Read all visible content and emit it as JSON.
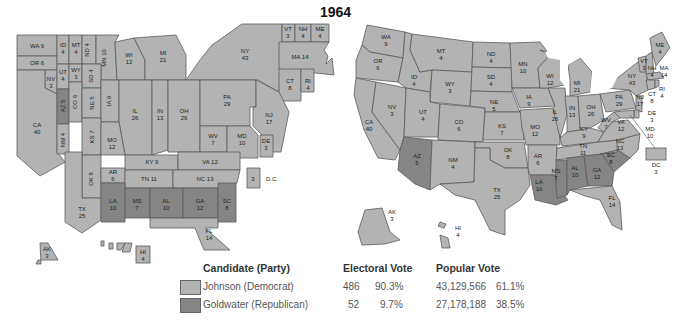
{
  "title": "1964",
  "colors": {
    "democrat": "#b3b3b3",
    "republican": "#858585",
    "border": "#5a5a5a"
  },
  "legend": {
    "headers": {
      "candidate": "Candidate (Party)",
      "electoral": "Electoral Vote",
      "popular": "Popular Vote"
    },
    "rows": [
      {
        "name": "Johnson (Democrat)",
        "party": "democrat",
        "ev": "486",
        "ev_pct": "90.3%",
        "pv": "43,129,566",
        "pv_pct": "61.1%"
      },
      {
        "name": "Goldwater (Republican)",
        "party": "republican",
        "ev": "52",
        "ev_pct": "9.7%",
        "pv": "27,178,188",
        "pv_pct": "38.5%"
      }
    ]
  },
  "cartogram": {
    "WA": "WA 9",
    "OR": "OR 6",
    "ID": "ID",
    "ID_v": "4",
    "MT": "MT",
    "MT_v": "4",
    "ND": "ND 4",
    "MN": "MN 10",
    "WI": "WI",
    "WI_v": "12",
    "MI": "MI",
    "MI_v": "21",
    "NY": "NY",
    "NY_v": "43",
    "VT": "VT",
    "VT_v": "3",
    "NH": "NH",
    "NH_v": "4",
    "ME": "ME",
    "ME_v": "4",
    "MA": "MA 14",
    "CT": "CT",
    "CT_v": "8",
    "RI": "RI",
    "RI_v": "4",
    "NV": "NV",
    "NV_v": "3",
    "UT": "UT",
    "UT_v": "4",
    "WY": "WY",
    "WY_v": "3",
    "SD": "SD 4",
    "CA": "CA",
    "CA_v": "40",
    "AZ": "AZ 5",
    "CO": "CO 6",
    "NE": "NE 5",
    "IA": "IA 9",
    "IL": "IL",
    "IL_v": "26",
    "IN": "IN",
    "IN_v": "13",
    "OH": "OH",
    "OH_v": "26",
    "PA": "PA",
    "PA_v": "29",
    "NJ": "NJ",
    "NJ_v": "17",
    "NM": "NM 4",
    "KS": "KS 7",
    "MO": "MO",
    "MO_v": "12",
    "WV": "WV",
    "WV_v": "7",
    "MD": "MD",
    "MD_v": "10",
    "DE": "DE",
    "DE_v": "3",
    "KY": "KY 9",
    "VA": "VA 12",
    "OK": "OK 8",
    "AR": "AR",
    "AR_v": "6",
    "TN": "TN 11",
    "NC": "NC 13",
    "DC": "3",
    "DC_label": "D.C.",
    "TX": "TX",
    "TX_v": "25",
    "LA": "LA",
    "LA_v": "10",
    "MS": "MS",
    "MS_v": "7",
    "AL": "AL",
    "AL_v": "10",
    "GA": "GA",
    "GA_v": "12",
    "SC": "SC",
    "SC_v": "8",
    "FL": "FL",
    "FL_v": "14",
    "AK": "AK",
    "AK_v": "3",
    "HI": "HI",
    "HI_v": "4"
  },
  "geomap": {
    "WA": "WA",
    "WA_v": "9",
    "OR": "OR",
    "OR_v": "6",
    "CA": "CA",
    "CA_v": "40",
    "NV": "NV",
    "NV_v": "3",
    "ID": "ID",
    "ID_v": "4",
    "MT": "MT",
    "MT_v": "4",
    "WY": "WY",
    "WY_v": "3",
    "UT": "UT",
    "UT_v": "4",
    "CO": "CO",
    "CO_v": "6",
    "AZ": "AZ",
    "AZ_v": "5",
    "NM": "NM",
    "NM_v": "4",
    "ND": "ND",
    "ND_v": "4",
    "SD": "SD",
    "SD_v": "4",
    "NE": "NE",
    "NE_v": "5",
    "KS": "KS",
    "KS_v": "7",
    "OK": "OK",
    "OK_v": "8",
    "TX": "TX",
    "TX_v": "25",
    "MN": "MN",
    "MN_v": "10",
    "IA": "IA",
    "IA_v": "9",
    "MO": "MO",
    "MO_v": "12",
    "AR": "AR",
    "AR_v": "6",
    "LA": "LA",
    "LA_v": "10",
    "WI": "WI",
    "WI_v": "12",
    "IL": "IL",
    "IL_v": "26",
    "MI": "MI",
    "MI_v": "21",
    "IN": "IN",
    "IN_v": "13",
    "OH": "OH",
    "OH_v": "26",
    "KY": "KY",
    "KY_v": "9",
    "TN": "TN",
    "TN_v": "11",
    "MS": "MS",
    "MS_v": "7",
    "AL": "AL",
    "AL_v": "10",
    "GA": "GA",
    "GA_v": "12",
    "FL": "FL",
    "FL_v": "14",
    "SC": "SC",
    "SC_v": "8",
    "NC": "NC",
    "NC_v": "13",
    "VA": "VA",
    "VA_v": "12",
    "WV": "WV",
    "WV_v": "7",
    "PA": "PA",
    "PA_v": "29",
    "NY": "NY",
    "NY_v": "43",
    "VT": "VT",
    "VT_v": "3",
    "NH": "NH",
    "NH_v": "4",
    "ME": "ME",
    "ME_v": "4",
    "MA": "MA",
    "MA_v": "14",
    "RI": "RI",
    "RI_v": "4",
    "CT": "CT",
    "CT_v": "8",
    "NJ": "NJ",
    "NJ_v": "17",
    "DE": "DE",
    "DE_v": "3",
    "MD": "MD",
    "MD_v": "10",
    "DC": "DC",
    "DC_v": "3",
    "AK": "AK",
    "AK_v": "3",
    "HI": "HI",
    "HI_v": "4"
  }
}
